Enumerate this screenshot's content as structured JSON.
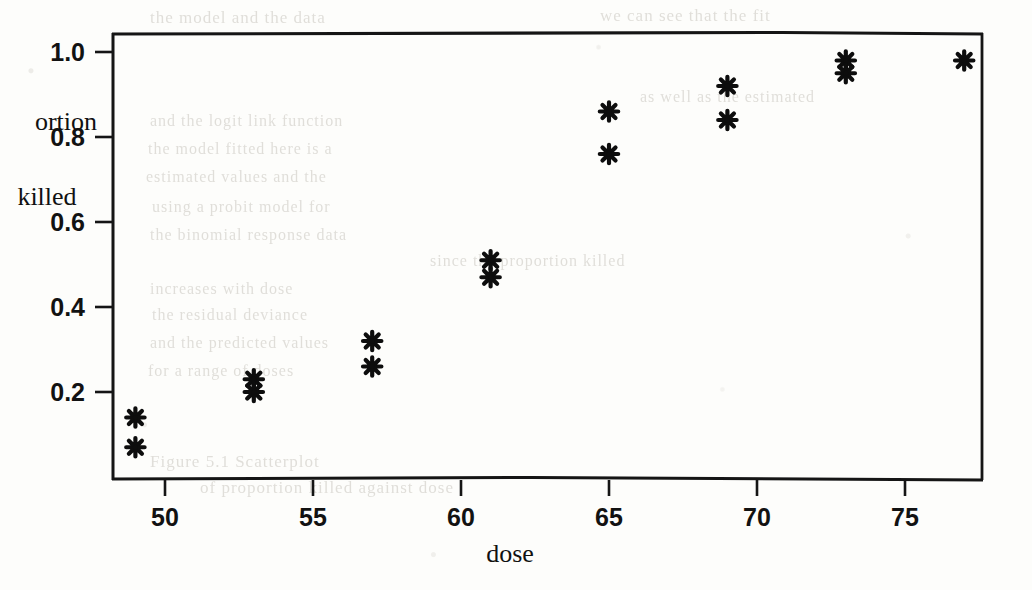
{
  "chart_data": {
    "type": "scatter",
    "title": "",
    "xlabel": "dose",
    "ylabel_lines": [
      "ortion",
      "killed"
    ],
    "ylabel_full": "proportion killed",
    "xlim": [
      47.3,
      78.9
    ],
    "ylim": [
      0.0,
      1.053
    ],
    "grid": false,
    "legend": null,
    "marker": "asterisk",
    "marker_color": "#0d0d0d",
    "x": [
      49,
      49,
      53,
      53,
      57,
      57,
      61,
      61,
      65,
      65,
      69,
      69,
      73,
      73,
      77
    ],
    "y": [
      0.14,
      0.07,
      0.23,
      0.2,
      0.32,
      0.26,
      0.51,
      0.47,
      0.86,
      0.76,
      0.92,
      0.84,
      0.98,
      0.95,
      0.98
    ],
    "points": [
      {
        "dose": 49,
        "proportion_killed": 0.14
      },
      {
        "dose": 49,
        "proportion_killed": 0.07
      },
      {
        "dose": 53,
        "proportion_killed": 0.23
      },
      {
        "dose": 53,
        "proportion_killed": 0.2
      },
      {
        "dose": 57,
        "proportion_killed": 0.32
      },
      {
        "dose": 57,
        "proportion_killed": 0.26
      },
      {
        "dose": 61,
        "proportion_killed": 0.51
      },
      {
        "dose": 61,
        "proportion_killed": 0.47
      },
      {
        "dose": 65,
        "proportion_killed": 0.86
      },
      {
        "dose": 65,
        "proportion_killed": 0.76
      },
      {
        "dose": 69,
        "proportion_killed": 0.92
      },
      {
        "dose": 69,
        "proportion_killed": 0.84
      },
      {
        "dose": 73,
        "proportion_killed": 0.98
      },
      {
        "dose": 73,
        "proportion_killed": 0.95
      },
      {
        "dose": 77,
        "proportion_killed": 0.98
      }
    ],
    "xticks": [
      50,
      55,
      60,
      65,
      70,
      75
    ],
    "xtick_labels": [
      "50",
      "55",
      "60",
      "65",
      "70",
      "75"
    ],
    "yticks": [
      0.2,
      0.4,
      0.6,
      0.8,
      1.0
    ],
    "ytick_labels": [
      "0.2",
      "0.4",
      "0.6",
      "0.8",
      "1.0"
    ]
  },
  "background_text": {
    "note": "faint show-through text from reverse side of scanned page",
    "lines": [
      {
        "text": "the model and the data",
        "x": 150,
        "y": 8,
        "size": 17
      },
      {
        "text": "we can see that the fit",
        "x": 600,
        "y": 6,
        "size": 17
      },
      {
        "text": "as well as the estimated",
        "x": 640,
        "y": 88,
        "size": 16
      },
      {
        "text": "and the logit link function",
        "x": 150,
        "y": 112,
        "size": 16
      },
      {
        "text": "the model fitted here is a",
        "x": 148,
        "y": 140,
        "size": 16
      },
      {
        "text": "estimated values and the",
        "x": 146,
        "y": 168,
        "size": 16
      },
      {
        "text": "using a probit model for",
        "x": 152,
        "y": 198,
        "size": 16
      },
      {
        "text": "the binomial response data",
        "x": 150,
        "y": 226,
        "size": 16
      },
      {
        "text": "since the proportion killed",
        "x": 430,
        "y": 252,
        "size": 16
      },
      {
        "text": "increases with dose",
        "x": 150,
        "y": 280,
        "size": 16
      },
      {
        "text": "the residual deviance",
        "x": 152,
        "y": 306,
        "size": 16
      },
      {
        "text": "and the predicted values",
        "x": 150,
        "y": 334,
        "size": 16
      },
      {
        "text": "for a range of doses",
        "x": 148,
        "y": 362,
        "size": 16
      },
      {
        "text": "Figure 5.1 Scatterplot",
        "x": 150,
        "y": 452,
        "size": 17
      },
      {
        "text": "of proportion killed against dose",
        "x": 200,
        "y": 478,
        "size": 17
      }
    ]
  }
}
